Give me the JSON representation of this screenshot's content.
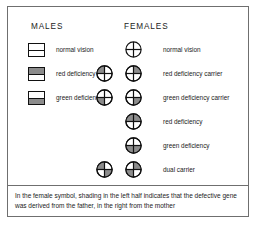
{
  "figure": {
    "columns": {
      "males_header": "MALES",
      "females_header": "FEMALES"
    },
    "colors": {
      "border": "#6f6f6f",
      "symbol_outline": "#111111",
      "shading_fill": "#8c8c8c",
      "background": "#ffffff",
      "text": "#1a1a1a"
    },
    "male_rows": [
      {
        "label": "normal vision",
        "symbol": "male-square-split",
        "top_half": "unshaded",
        "bottom_half": "unshaded"
      },
      {
        "label": "red deficiency",
        "symbol": "male-square-split",
        "top_half": "shaded",
        "bottom_half": "unshaded"
      },
      {
        "label": "green deficiency",
        "symbol": "male-square-split",
        "top_half": "unshaded",
        "bottom_half": "shaded"
      }
    ],
    "female_rows": [
      {
        "label": "normal vision",
        "symbols": [
          {
            "position": "right",
            "symbol": "female-circle-quartered",
            "quadrants": {
              "top_left": "unshaded",
              "top_right": "unshaded",
              "bottom_left": "unshaded",
              "bottom_right": "unshaded"
            }
          }
        ]
      },
      {
        "label": "red deficiency carrier",
        "symbols": [
          {
            "position": "left",
            "symbol": "female-circle-quartered",
            "quadrants": {
              "top_left": "shaded",
              "top_right": "unshaded",
              "bottom_left": "unshaded",
              "bottom_right": "unshaded"
            }
          },
          {
            "position": "right",
            "symbol": "female-circle-quartered",
            "quadrants": {
              "top_left": "unshaded",
              "top_right": "shaded",
              "bottom_left": "unshaded",
              "bottom_right": "unshaded"
            }
          }
        ]
      },
      {
        "label": "green deficiency carrier",
        "symbols": [
          {
            "position": "left",
            "symbol": "female-circle-quartered",
            "quadrants": {
              "top_left": "unshaded",
              "top_right": "unshaded",
              "bottom_left": "shaded",
              "bottom_right": "unshaded"
            }
          },
          {
            "position": "right",
            "symbol": "female-circle-quartered",
            "quadrants": {
              "top_left": "unshaded",
              "top_right": "unshaded",
              "bottom_left": "unshaded",
              "bottom_right": "shaded"
            }
          }
        ]
      },
      {
        "label": "red deficiency",
        "symbols": [
          {
            "position": "right",
            "symbol": "female-circle-quartered",
            "quadrants": {
              "top_left": "shaded",
              "top_right": "shaded",
              "bottom_left": "unshaded",
              "bottom_right": "unshaded"
            }
          }
        ]
      },
      {
        "label": "green deficiency",
        "symbols": [
          {
            "position": "right",
            "symbol": "female-circle-quartered",
            "quadrants": {
              "top_left": "unshaded",
              "top_right": "unshaded",
              "bottom_left": "shaded",
              "bottom_right": "shaded"
            }
          }
        ]
      },
      {
        "label": "dual carrier",
        "symbols": [
          {
            "position": "left",
            "symbol": "female-circle-quartered",
            "quadrants": {
              "top_left": "shaded",
              "top_right": "unshaded",
              "bottom_left": "unshaded",
              "bottom_right": "shaded"
            }
          },
          {
            "position": "right",
            "symbol": "female-circle-quartered",
            "quadrants": {
              "top_left": "unshaded",
              "top_right": "shaded",
              "bottom_left": "shaded",
              "bottom_right": "unshaded"
            }
          }
        ]
      }
    ],
    "caption": "In the female symbol, shading in the left half indicates that the defective gene was derived from the father, in the right from the mother"
  }
}
